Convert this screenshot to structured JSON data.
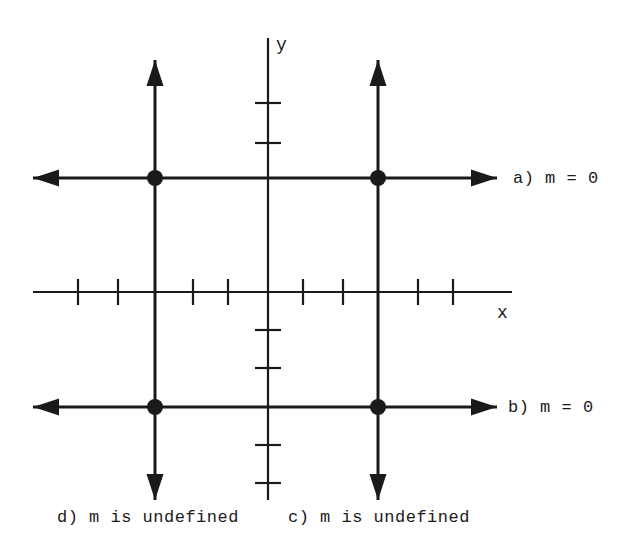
{
  "figure": {
    "width": 628,
    "height": 559,
    "background_color": "#ffffff",
    "ink_color": "#1a1a1a"
  },
  "axes": {
    "x_label": "x",
    "y_label": "y",
    "x_axis": {
      "y_pixel": 292,
      "x_start": 33,
      "x_end": 512,
      "tick_pixels": [
        78,
        118,
        193,
        228,
        303,
        343,
        418,
        453
      ],
      "tick_half_length": 13
    },
    "y_axis": {
      "x_pixel": 268,
      "y_start": 38,
      "y_end": 500,
      "tick_pixels": [
        103,
        143,
        330,
        368,
        445,
        483
      ],
      "tick_half_length": 13
    },
    "origin": {
      "x": 268,
      "y": 292
    }
  },
  "lines": [
    {
      "id": "a",
      "label": "a) m = 0",
      "orientation": "horizontal",
      "slope_text": "m = 0",
      "slope_value": "0",
      "y_pixel": 178,
      "x_start": 33,
      "x_end": 497,
      "arrow_start": true,
      "arrow_end": true
    },
    {
      "id": "b",
      "label": "b) m = 0",
      "orientation": "horizontal",
      "slope_text": "m = 0",
      "slope_value": "0",
      "y_pixel": 407,
      "x_start": 33,
      "x_end": 497,
      "arrow_start": true,
      "arrow_end": true
    },
    {
      "id": "c",
      "label": "c) m is undefined",
      "orientation": "vertical",
      "slope_text": "m is undefined",
      "slope_value": "undefined",
      "x_pixel": 378,
      "y_start": 60,
      "y_end": 500,
      "arrow_start": true,
      "arrow_end": true
    },
    {
      "id": "d",
      "label": "d) m is undefined",
      "orientation": "vertical",
      "slope_text": "m is undefined",
      "slope_value": "undefined",
      "x_pixel": 155,
      "y_start": 60,
      "y_end": 500,
      "arrow_start": true,
      "arrow_end": true
    }
  ],
  "intersection_points": [
    {
      "name": "a-d",
      "x": 155,
      "y": 178
    },
    {
      "name": "a-c",
      "x": 378,
      "y": 178
    },
    {
      "name": "b-d",
      "x": 155,
      "y": 407
    },
    {
      "name": "b-c",
      "x": 378,
      "y": 407
    }
  ],
  "chart_data": {
    "type": "line",
    "title": "",
    "xlabel": "x",
    "ylabel": "y",
    "grid": false,
    "legend": "none",
    "xlim": [
      -6,
      6
    ],
    "ylim": [
      -6,
      6
    ],
    "annotations": [
      "a) m = 0",
      "b) m = 0",
      "c) m is undefined",
      "d) m is undefined"
    ],
    "series": [
      {
        "name": "a) m = 0",
        "kind": "horizontal-line",
        "equation": "y = 3",
        "slope": 0,
        "x": [
          -6,
          6
        ],
        "values": [
          3,
          3
        ]
      },
      {
        "name": "b) m = 0",
        "kind": "horizontal-line",
        "equation": "y = -3",
        "slope": 0,
        "x": [
          -6,
          6
        ],
        "values": [
          -3,
          -3
        ]
      },
      {
        "name": "c) m is undefined",
        "kind": "vertical-line",
        "equation": "x = 3",
        "slope": "undefined",
        "x": [
          3,
          3
        ],
        "values": [
          -6,
          6
        ]
      },
      {
        "name": "d) m is undefined",
        "kind": "vertical-line",
        "equation": "x = -3",
        "slope": "undefined",
        "x": [
          -3,
          -3
        ],
        "values": [
          -6,
          6
        ]
      }
    ],
    "points": [
      {
        "label": "a-d",
        "x": -3,
        "y": 3
      },
      {
        "label": "a-c",
        "x": 3,
        "y": 3
      },
      {
        "label": "b-d",
        "x": -3,
        "y": -3
      },
      {
        "label": "b-c",
        "x": 3,
        "y": -3
      }
    ]
  }
}
